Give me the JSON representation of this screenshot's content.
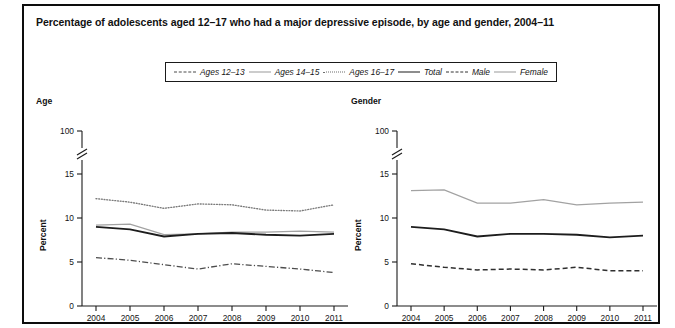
{
  "figure": {
    "title": "Percentage of adolescents aged 12–17 who had a major depressive episode, by age and gender, 2004–11",
    "footnote": ""
  },
  "legend": {
    "entries": [
      {
        "label": "Ages 12–13",
        "style": "dashdot",
        "color": "#4d4d4d"
      },
      {
        "label": "Ages 14–15",
        "style": "thin",
        "color": "#a2a2a2"
      },
      {
        "label": "Ages 16–17",
        "style": "dotted",
        "color": "#7b7b7b"
      },
      {
        "label": "Total",
        "style": "thick",
        "color": "#1d1d1d"
      },
      {
        "label": "Male",
        "style": "dashed",
        "color": "#2f2f2f"
      },
      {
        "label": "Female",
        "style": "thin",
        "color": "#a2a2a2"
      }
    ]
  },
  "panels": {
    "age": {
      "title": "Age",
      "ylabel": "Percent"
    },
    "gender": {
      "title": "Gender",
      "ylabel": "Percent"
    }
  },
  "chart_data": [
    {
      "type": "line",
      "title": "Age",
      "xlabel": "",
      "ylabel": "Percent",
      "x": [
        2004,
        2005,
        2006,
        2007,
        2008,
        2009,
        2010,
        2011
      ],
      "xtick_labels": [
        "2004",
        "2005",
        "2006",
        "2007",
        "2008",
        "2009",
        "2010",
        "2011"
      ],
      "ytick_labels": [
        "0",
        "5",
        "10",
        "15",
        "100"
      ],
      "ytick_values": [
        0,
        5,
        10,
        15,
        100
      ],
      "ylim": [
        0,
        100
      ],
      "axis_break": {
        "between": [
          15,
          100
        ],
        "marker": "double-slash"
      },
      "grid": false,
      "legend_position": "top-center",
      "series": [
        {
          "name": "Ages 16–17",
          "style": "dotted",
          "values": [
            12.2,
            11.8,
            11.1,
            11.6,
            11.5,
            10.9,
            10.8,
            11.5
          ]
        },
        {
          "name": "Ages 14–15",
          "style": "thin",
          "values": [
            9.2,
            9.3,
            8.1,
            8.2,
            8.4,
            8.4,
            8.5,
            8.4
          ]
        },
        {
          "name": "Total",
          "style": "thick",
          "values": [
            9.0,
            8.7,
            7.9,
            8.2,
            8.3,
            8.1,
            8.0,
            8.2
          ]
        },
        {
          "name": "Ages 12–13",
          "style": "dashdot",
          "values": [
            5.5,
            5.2,
            4.7,
            4.2,
            4.8,
            4.5,
            4.2,
            3.8
          ]
        }
      ]
    },
    {
      "type": "line",
      "title": "Gender",
      "xlabel": "",
      "ylabel": "Percent",
      "x": [
        2004,
        2005,
        2006,
        2007,
        2008,
        2009,
        2010,
        2011
      ],
      "xtick_labels": [
        "2004",
        "2005",
        "2006",
        "2007",
        "2008",
        "2009",
        "2010",
        "2011"
      ],
      "ytick_labels": [
        "0",
        "5",
        "10",
        "15",
        "100"
      ],
      "ytick_values": [
        0,
        5,
        10,
        15,
        100
      ],
      "ylim": [
        0,
        100
      ],
      "axis_break": {
        "between": [
          15,
          100
        ],
        "marker": "double-slash"
      },
      "grid": false,
      "legend_position": "top-center",
      "series": [
        {
          "name": "Female",
          "style": "thin",
          "values": [
            13.1,
            13.2,
            11.7,
            11.7,
            12.1,
            11.5,
            11.7,
            11.8
          ]
        },
        {
          "name": "Total",
          "style": "thick",
          "values": [
            9.0,
            8.7,
            7.9,
            8.2,
            8.2,
            8.1,
            7.8,
            8.0
          ]
        },
        {
          "name": "Male",
          "style": "dashed",
          "values": [
            4.8,
            4.4,
            4.1,
            4.2,
            4.1,
            4.4,
            4.0,
            4.0
          ]
        }
      ]
    }
  ]
}
